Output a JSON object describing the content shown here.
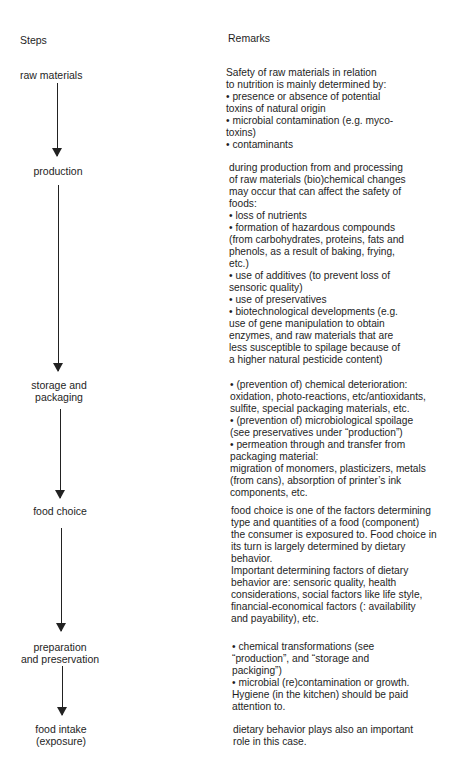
{
  "headers": {
    "steps": "Steps",
    "remarks": "Remarks"
  },
  "steps": [
    {
      "label_lines": [
        "raw materials"
      ]
    },
    {
      "label_lines": [
        "production"
      ]
    },
    {
      "label_lines": [
        "storage and",
        "packaging"
      ]
    },
    {
      "label_lines": [
        "food choice"
      ]
    },
    {
      "label_lines": [
        "preparation",
        "and preservation"
      ]
    },
    {
      "label_lines": [
        "food intake",
        "(exposure)"
      ]
    }
  ],
  "remarks": [
    {
      "lines": [
        "Safety of raw materials in relation",
        "to nutrition is mainly determined by:",
        "• presence or absence of potential",
        "toxins of natural origin",
        "• microbial contamination (e.g. myco-",
        "toxins)",
        "• contaminants"
      ]
    },
    {
      "lines": [
        "during production from and processing",
        "of raw materials (bio)chemical changes",
        "may occur that can affect the safety of",
        "foods:",
        "• loss of nutrients",
        "• formation of hazardous compounds",
        "(from carbohydrates, proteins, fats and",
        "phenols, as a result of baking, frying,",
        "etc.)",
        "• use of additives (to prevent loss of",
        "sensoric quality)",
        "• use of preservatives",
        "• biotechnological developments (e.g.",
        "use of gene manipulation to obtain",
        "enzymes, and raw materials that are",
        "less susceptible to spilage because of",
        "a higher natural pesticide content)"
      ]
    },
    {
      "lines": [
        "• (prevention of) chemical deterioration:",
        "oxidation, photo-reactions, etc/antioxidants,",
        "sulfite, special packaging materials, etc.",
        "• (prevention of) microbiological spoilage",
        "(see preservatives under “production”)",
        "• permeation through and transfer from",
        "packaging material:",
        "migration of monomers, plasticizers, metals",
        "(from cans), absorption of printer’s ink",
        "components, etc."
      ]
    },
    {
      "lines": [
        "food choice is one of the factors determining",
        "type and quantities of a food (component)",
        "the consumer is exposured to. Food choice in",
        "its turn is largely determined by dietary",
        "behavior.",
        "Important determining factors of dietary",
        "behavior are: sensoric quality, health",
        "considerations, social factors like life style,",
        "financial-economical factors (: availability",
        "and payability), etc."
      ]
    },
    {
      "lines": [
        "• chemical transformations (see",
        "“production”, and “storage and",
        "packiging”)",
        "• microbial (re)contamination or growth.",
        "Hygiene (in the kitchen) should be paid",
        "attention to."
      ]
    },
    {
      "lines": [
        "dietary behavior plays also an important",
        "role in this case."
      ]
    }
  ]
}
